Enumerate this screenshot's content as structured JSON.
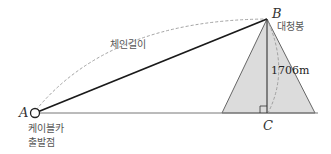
{
  "diagram": {
    "points": {
      "A": {
        "label": "A",
        "x": 35,
        "y": 113
      },
      "B": {
        "label": "B",
        "x": 267,
        "y": 19
      },
      "C": {
        "label": "C",
        "x": 268,
        "y": 113
      }
    },
    "labels": {
      "chain_length": "체인길이",
      "peak_name": "대청봉",
      "height": "1706m",
      "start_line1": "케이블카",
      "start_line2": "출발점"
    },
    "colors": {
      "line": "#1a1a1a",
      "ground": "#777777",
      "mountain_fill": "#dcdcdc",
      "mountain_edge": "#666666",
      "dashed": "#999999"
    }
  }
}
